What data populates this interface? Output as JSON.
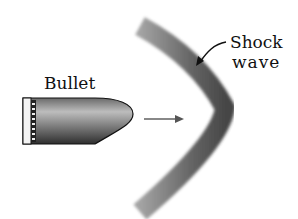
{
  "labels": {
    "bullet": "Bullet",
    "shock_line1": "Shock",
    "shock_line2": "wave"
  },
  "colors": {
    "ink": "#111111",
    "wave": "#444444",
    "bullet_light": "#e8e8e8",
    "bullet_dark": "#3a3a3a",
    "arrow": "#555555"
  }
}
